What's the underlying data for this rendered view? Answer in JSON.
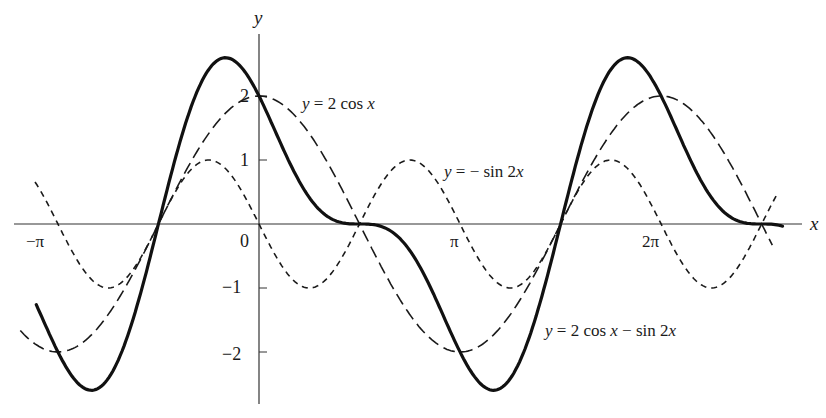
{
  "chart_data": {
    "type": "line",
    "title": "",
    "xlabel": "x",
    "ylabel": "y",
    "xlim": [
      -3.73,
      8.43
    ],
    "ylim": [
      -2.8,
      3.3
    ],
    "grid": false,
    "legend_position": "inline annotations",
    "x_ticks": [
      {
        "value": -3.14159,
        "label": "−π"
      },
      {
        "value": 0,
        "label": "0"
      },
      {
        "value": 3.14159,
        "label": "π"
      },
      {
        "value": 6.28319,
        "label": "2π"
      }
    ],
    "y_ticks": [
      {
        "value": 2,
        "label": "2"
      },
      {
        "value": 1,
        "label": "1"
      },
      {
        "value": -1,
        "label": "−1"
      },
      {
        "value": -2,
        "label": "−2"
      }
    ],
    "series": [
      {
        "name": "y = 2 cos x",
        "style": "long-dash",
        "color": "#1a1a1a",
        "x_range": [
          -3.73,
          8.02
        ],
        "formula": "2*cos(x)",
        "sample_points": [
          [
            -3.14,
            -2
          ],
          [
            -1.57,
            0
          ],
          [
            0,
            2
          ],
          [
            1.57,
            0
          ],
          [
            3.14,
            -2
          ],
          [
            4.71,
            0
          ],
          [
            6.28,
            2
          ],
          [
            7.85,
            0
          ]
        ]
      },
      {
        "name": "y = − sin 2x",
        "style": "short-dash",
        "color": "#1a1a1a",
        "x_range": [
          -3.5,
          8.1
        ],
        "formula": "-sin(2*x)",
        "sample_points": [
          [
            -3.14,
            0
          ],
          [
            -2.36,
            -1
          ],
          [
            -1.57,
            0
          ],
          [
            -0.79,
            1
          ],
          [
            0,
            0
          ],
          [
            0.79,
            -1
          ],
          [
            1.57,
            0
          ],
          [
            2.36,
            1
          ],
          [
            3.14,
            0
          ],
          [
            3.93,
            -1
          ],
          [
            4.71,
            0
          ],
          [
            5.5,
            1
          ],
          [
            6.28,
            0
          ],
          [
            7.07,
            -1
          ],
          [
            7.85,
            0
          ]
        ]
      },
      {
        "name": "y = 2 cos x − sin 2x",
        "style": "solid-bold",
        "color": "#111111",
        "x_range": [
          -3.48,
          8.18
        ],
        "formula": "2*cos(x)-sin(2*x)",
        "sample_points": [
          [
            -2.62,
            -2.6
          ],
          [
            -1.57,
            0
          ],
          [
            -0.52,
            2.6
          ],
          [
            0,
            2
          ],
          [
            1.57,
            0
          ],
          [
            3.66,
            -2.6
          ],
          [
            4.71,
            0
          ],
          [
            5.76,
            2.6
          ],
          [
            7.85,
            0
          ]
        ]
      }
    ],
    "annotations": [
      {
        "text_pre": "y",
        "text_post": " = 2 cos ",
        "text_var": "x",
        "near_series": "y = 2 cos x"
      },
      {
        "text_pre": "y",
        "text_post": " = −  sin 2",
        "text_var": "x",
        "near_series": "y = − sin 2x"
      },
      {
        "text_pre": "y",
        "text_post": " = 2 cos ",
        "text_var": "x",
        "text_post2": " − sin 2",
        "text_var2": "x",
        "near_series": "y = 2 cos x − sin 2x"
      }
    ]
  },
  "axes": {
    "x_label": "x",
    "y_label": "y",
    "origin_label": "0",
    "x_tick_labels": [
      "−π",
      "π",
      "2π"
    ],
    "y_tick_labels": [
      "2",
      "1",
      "−1",
      "−2"
    ]
  },
  "labels": {
    "cos": {
      "y": "y",
      "eq": " = 2 cos ",
      "x": "x"
    },
    "sin": {
      "y": "y",
      "eq": " = −  sin 2",
      "x": "x"
    },
    "sum": {
      "y": "y",
      "eq": " = 2 cos ",
      "x": "x",
      "eq2": " − sin 2",
      "x2": "x"
    }
  }
}
